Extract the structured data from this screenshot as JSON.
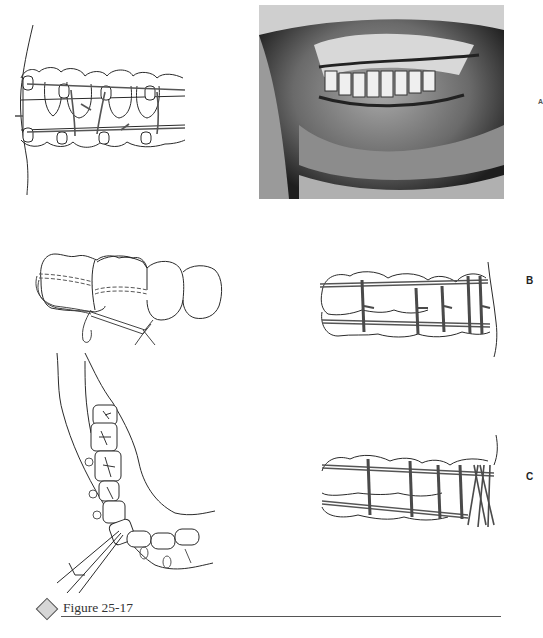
{
  "figure": {
    "number_label": "Figure 25-17",
    "panels": {
      "a": {
        "label": "A",
        "type": "illustration-and-photo",
        "description": "Interdental wiring with arch bars, drawing and intraoral photograph"
      },
      "b": {
        "label": "B",
        "type": "illustration",
        "description": "Wired dental arch, lateral view"
      },
      "c": {
        "label": "C",
        "type": "illustration",
        "description": "Wired dental arch with continuous loop wiring, lateral view"
      }
    },
    "caption_partial_text": ""
  },
  "colors": {
    "line": "#2a2a2a",
    "wire": "#555555",
    "diamond_fill": "#d6d6d6",
    "rule": "#555555",
    "photo_bg": "#3a3a3a"
  }
}
